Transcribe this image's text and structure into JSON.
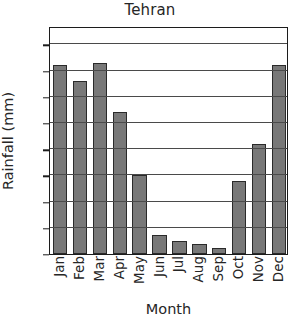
{
  "chart_data": {
    "type": "bar",
    "title": "Tehran",
    "xlabel": "Month",
    "ylabel": "Rainfall (mm)",
    "categories": [
      "Jan",
      "Feb",
      "Mar",
      "Apr",
      "May",
      "Jun",
      "Jul",
      "Aug",
      "Sep",
      "Oct",
      "Nov",
      "Dec"
    ],
    "values": [
      36,
      33,
      36.5,
      27,
      15,
      3.7,
      2.5,
      2,
      1.2,
      14,
      21,
      36
    ],
    "ylim": [
      0,
      43.5
    ],
    "yticks": [
      0,
      5,
      10,
      15,
      20,
      25,
      30,
      35,
      40
    ],
    "ytick_labels": [
      "0",
      "5",
      "10",
      "15",
      "20",
      "25",
      "30",
      "35",
      "40"
    ],
    "grid": "horizontal",
    "legend": "none",
    "bar_color": "#787878",
    "bar_edge_color": "#2a2a2a",
    "axis_color": "#1c1c1c",
    "grid_color": "#4a4a4a",
    "background_color": "#ffffff",
    "text_color": "#262626"
  }
}
